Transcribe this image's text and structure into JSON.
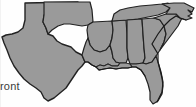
{
  "image": {
    "kind": "regional-map-graphic",
    "region_title": "Southeastern United States",
    "background_color": "#fefefe",
    "width_px": 196,
    "height_px": 107
  },
  "caption": {
    "visible_text": "ront",
    "note": "text fragment clipped at the left edge of the image"
  },
  "map_style": {
    "land_fill": "#9a9a9a",
    "state_border_color": "#2b2b2b",
    "outer_border_color": "#1a1a1a",
    "water_fill": "#fefefe",
    "state_border_width": 1,
    "outer_border_width": 1.6
  },
  "map_data": {
    "type": "choropleth-outline",
    "projection": "plate-carree-approx",
    "highlighted": true,
    "states": [
      {
        "name": "Texas",
        "abbr": "TX"
      },
      {
        "name": "Oklahoma",
        "abbr": "OK"
      },
      {
        "name": "Arkansas",
        "abbr": "AR"
      },
      {
        "name": "Louisiana",
        "abbr": "LA"
      },
      {
        "name": "Mississippi",
        "abbr": "MS"
      },
      {
        "name": "Alabama",
        "abbr": "AL"
      },
      {
        "name": "Tennessee",
        "abbr": "TN"
      },
      {
        "name": "Georgia",
        "abbr": "GA"
      },
      {
        "name": "Florida",
        "abbr": "FL"
      },
      {
        "name": "South Carolina",
        "abbr": "SC"
      },
      {
        "name": "North Carolina",
        "abbr": "NC"
      }
    ],
    "labels_shown": false,
    "legend_shown": false
  }
}
